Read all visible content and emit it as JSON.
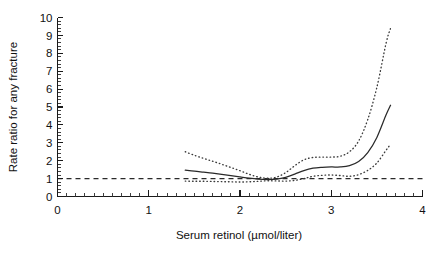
{
  "chart_data": {
    "type": "line",
    "title": "",
    "subtitle": "",
    "xlabel": "Serum retinol (µmol/liter)",
    "ylabel": "Rate ratio for any fracture",
    "xlim": [
      0,
      4
    ],
    "ylim": [
      0,
      10
    ],
    "xticks": [
      0,
      1,
      2,
      3,
      4
    ],
    "yticks": [
      0,
      1,
      2,
      3,
      4,
      5,
      6,
      7,
      8,
      9,
      10
    ],
    "xtick_labels": [
      "0",
      "1",
      "2",
      "3",
      "4"
    ],
    "ytick_labels": [
      "0",
      "1",
      "2",
      "3",
      "4",
      "5",
      "6",
      "7",
      "8",
      "9",
      "10"
    ],
    "x_minor_tick_step": 0.1,
    "y_minor_tick_step": 0.2,
    "grid": false,
    "legend": null,
    "legend_position": "none",
    "reference_lines": [
      {
        "name": "null-rate-ratio",
        "orientation": "horizontal",
        "value": 1,
        "style": "dashed",
        "x_start": 0,
        "x_end": 4
      }
    ],
    "annotations": [],
    "series": [
      {
        "name": "Rate ratio (smoothed estimate)",
        "style": "solid",
        "x": [
          1.4,
          1.5,
          1.6,
          1.7,
          1.8,
          1.9,
          2.0,
          2.1,
          2.2,
          2.3,
          2.4,
          2.5,
          2.6,
          2.7,
          2.8,
          2.9,
          3.0,
          3.1,
          3.2,
          3.3,
          3.4,
          3.5,
          3.6,
          3.65
        ],
        "values": [
          1.47,
          1.42,
          1.36,
          1.3,
          1.23,
          1.16,
          1.09,
          1.02,
          0.97,
          0.95,
          0.97,
          1.07,
          1.25,
          1.45,
          1.58,
          1.63,
          1.65,
          1.65,
          1.72,
          1.95,
          2.45,
          3.3,
          4.55,
          5.1
        ]
      },
      {
        "name": "Upper 95% confidence limit",
        "style": "dotted",
        "x": [
          1.4,
          1.5,
          1.6,
          1.7,
          1.8,
          1.9,
          2.0,
          2.1,
          2.2,
          2.3,
          2.4,
          2.5,
          2.6,
          2.7,
          2.8,
          2.9,
          3.0,
          3.1,
          3.2,
          3.3,
          3.4,
          3.5,
          3.6,
          3.65
        ],
        "values": [
          2.5,
          2.3,
          2.13,
          1.97,
          1.8,
          1.62,
          1.44,
          1.24,
          1.09,
          1.02,
          1.08,
          1.33,
          1.72,
          2.05,
          2.18,
          2.2,
          2.2,
          2.25,
          2.5,
          3.1,
          4.3,
          6.1,
          8.55,
          9.4
        ]
      },
      {
        "name": "Lower 95% confidence limit",
        "style": "dotted",
        "x": [
          1.4,
          1.5,
          1.6,
          1.7,
          1.8,
          1.9,
          2.0,
          2.1,
          2.2,
          2.3,
          2.4,
          2.5,
          2.6,
          2.7,
          2.8,
          2.9,
          3.0,
          3.1,
          3.2,
          3.3,
          3.4,
          3.5,
          3.6,
          3.65
        ],
        "values": [
          0.86,
          0.85,
          0.85,
          0.84,
          0.83,
          0.82,
          0.81,
          0.82,
          0.85,
          0.88,
          0.87,
          0.86,
          0.9,
          1.0,
          1.13,
          1.18,
          1.2,
          1.17,
          1.13,
          1.22,
          1.46,
          1.87,
          2.58,
          2.92
        ]
      }
    ],
    "colors": {
      "axis": "#1a1a1a",
      "center_line": "#2a2a2a",
      "confidence_band": "#3a3a3a",
      "reference_line": "#2a2a2a",
      "background": "#ffffff"
    }
  }
}
